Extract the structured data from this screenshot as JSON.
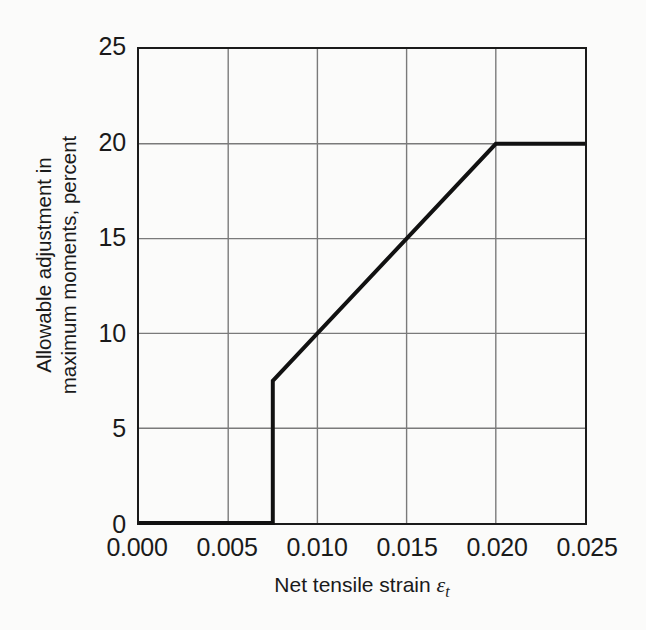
{
  "chart_data": {
    "type": "line",
    "title": "",
    "subtitle": "",
    "xlabel": "Net tensile strain",
    "xlabel_symbol": "ε",
    "xlabel_subscript": "t",
    "ylabel_line1": "Allowable adjustment in",
    "ylabel_line2": "maximum moments, percent",
    "xlim": [
      0.0,
      0.025
    ],
    "ylim": [
      0,
      25
    ],
    "xticks": [
      0.0,
      0.005,
      0.01,
      0.015,
      0.02,
      0.025
    ],
    "xtick_labels": [
      "0.000",
      "0.005",
      "0.010",
      "0.015",
      "0.020",
      "0.025"
    ],
    "yticks": [
      0,
      5,
      10,
      15,
      20,
      25
    ],
    "ytick_labels": [
      "0",
      "5",
      "10",
      "15",
      "20",
      "25"
    ],
    "grid": true,
    "legend": "none",
    "series": [
      {
        "name": "Allowable moment redistribution",
        "x": [
          0.0,
          0.0075,
          0.0075,
          0.01,
          0.015,
          0.02,
          0.025
        ],
        "y": [
          0,
          0,
          7.5,
          10,
          15,
          20,
          20
        ],
        "color": "#111111",
        "line_width": 4
      }
    ],
    "annotations": [
      {
        "note": "Flat at 0 percent from strain 0.000 to 0.0075"
      },
      {
        "note": "Vertical step from 0 to 7.5 percent at strain 0.0075"
      },
      {
        "note": "Linear rise from 7.5 percent to 20 percent between strain 0.0075 and 0.020"
      },
      {
        "note": "Flat plateau at 20 percent from strain 0.020 to 0.025"
      }
    ]
  },
  "colors": {
    "background": "#fbfbfa",
    "axis": "#1a1a1a",
    "grid": "#7a7a7a",
    "series": "#111111",
    "text": "#1a1a1a"
  }
}
